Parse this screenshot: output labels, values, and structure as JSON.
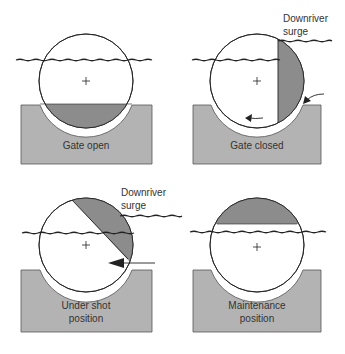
{
  "diagram": {
    "colors": {
      "sill": "#b3b3b3",
      "sill_stroke": "#555555",
      "gate_fill": "#ffffff",
      "gate_shade": "#8c8c8c",
      "line": "#222222"
    },
    "panels": [
      {
        "id": "gate-open",
        "label_lines": [
          "Gate open"
        ]
      },
      {
        "id": "gate-closed",
        "label_lines": [
          "Gate closed"
        ],
        "surge_label_lines": [
          "Downriver",
          "surge"
        ]
      },
      {
        "id": "under-shot",
        "label_lines": [
          "Under shot",
          "position"
        ],
        "surge_label_lines": [
          "Downriver",
          "surge"
        ]
      },
      {
        "id": "maintenance",
        "label_lines": [
          "Maintenance",
          "position"
        ]
      }
    ]
  }
}
